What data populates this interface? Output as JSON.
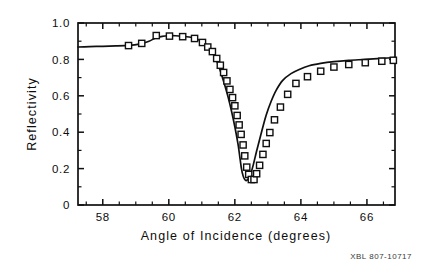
{
  "figure": {
    "caption": "XBL 807-10717",
    "caption_name": "figure-identifier"
  },
  "chart_data": {
    "type": "line",
    "title": "",
    "subtitle": "",
    "xlabel": "Angle of Incidence (degrees)",
    "ylabel": "Reflectivity",
    "xlim": [
      57.25,
      66.85
    ],
    "ylim": [
      0.0,
      1.0
    ],
    "grid": false,
    "legend": null,
    "legend_position": "none",
    "marker": "open-square",
    "line_style": "solid",
    "xticks": [
      58,
      60,
      62,
      64,
      66
    ],
    "xtick_labels": [
      "58",
      "60",
      "62",
      "64",
      "66"
    ],
    "xticks_minor": [
      57.5,
      58.5,
      59,
      59.5,
      60.5,
      61,
      61.5,
      62.5,
      63,
      63.5,
      64.5,
      65,
      65.5,
      66.5
    ],
    "yticks": [
      0,
      0.2,
      0.4,
      0.6,
      0.8,
      1.0
    ],
    "ytick_labels": [
      "0",
      "0.2",
      "0.4",
      "0.6",
      "0.8",
      "1.0"
    ],
    "yticks_minor": [
      0.1,
      0.3,
      0.5,
      0.7,
      0.9
    ],
    "series": [
      {
        "name": "Reflectivity curve",
        "kind": "line",
        "x": [
          57.25,
          57.6,
          58.0,
          58.4,
          58.8,
          59.1,
          59.4,
          59.6,
          59.8,
          60.0,
          60.2,
          60.45,
          60.7,
          60.9,
          61.05,
          61.2,
          61.3,
          61.4,
          61.5,
          61.6,
          61.7,
          61.8,
          61.9,
          62.0,
          62.1,
          62.15,
          62.2,
          62.25,
          62.3,
          62.35,
          62.45,
          62.55,
          62.65,
          62.75,
          62.85,
          62.95,
          63.1,
          63.25,
          63.45,
          63.7,
          63.95,
          64.25,
          64.6,
          65.0,
          65.45,
          65.95,
          66.45,
          66.85
        ],
        "y": [
          0.868,
          0.87,
          0.872,
          0.874,
          0.877,
          0.884,
          0.9,
          0.918,
          0.927,
          0.93,
          0.93,
          0.926,
          0.92,
          0.908,
          0.893,
          0.87,
          0.845,
          0.812,
          0.77,
          0.715,
          0.655,
          0.59,
          0.515,
          0.43,
          0.33,
          0.265,
          0.2,
          0.16,
          0.14,
          0.135,
          0.155,
          0.215,
          0.29,
          0.36,
          0.43,
          0.495,
          0.57,
          0.63,
          0.685,
          0.722,
          0.745,
          0.765,
          0.778,
          0.788,
          0.795,
          0.8,
          0.806,
          0.81
        ]
      },
      {
        "name": "Measured data points",
        "kind": "markers",
        "x": [
          58.78,
          59.18,
          59.62,
          60.02,
          60.42,
          60.78,
          61.02,
          61.18,
          61.32,
          61.45,
          61.56,
          61.66,
          61.76,
          61.85,
          61.93,
          62.0,
          62.07,
          62.13,
          62.19,
          62.25,
          62.3,
          62.36,
          62.42,
          62.5,
          62.58,
          62.66,
          62.75,
          62.85,
          62.95,
          63.06,
          63.2,
          63.38,
          63.6,
          63.85,
          64.2,
          64.6,
          65.0,
          65.45,
          65.95,
          66.45,
          66.8
        ],
        "y": [
          0.876,
          0.888,
          0.931,
          0.928,
          0.925,
          0.915,
          0.893,
          0.868,
          0.843,
          0.805,
          0.768,
          0.728,
          0.682,
          0.635,
          0.59,
          0.545,
          0.492,
          0.44,
          0.388,
          0.33,
          0.27,
          0.208,
          0.168,
          0.14,
          0.14,
          0.172,
          0.218,
          0.278,
          0.338,
          0.398,
          0.468,
          0.538,
          0.608,
          0.668,
          0.705,
          0.735,
          0.758,
          0.772,
          0.782,
          0.79,
          0.795
        ]
      }
    ]
  }
}
